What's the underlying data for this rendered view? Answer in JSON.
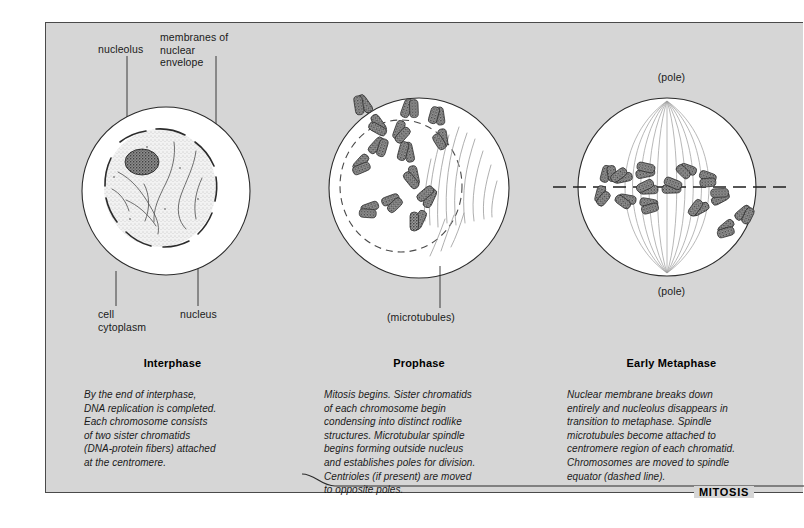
{
  "figure": {
    "bracket_label": "MITOSIS",
    "background_color": "#d6d6d6",
    "frame_border_color": "#4a4a4a"
  },
  "panels": [
    {
      "id": "interphase",
      "title": "Interphase",
      "caption": "By the end of interphase,\nDNA replication is completed.\nEach chromosome consists\nof two sister chromatids\n(DNA-protein fibers) attached\nat the centromere.",
      "callouts": [
        {
          "name": "nucleolus",
          "text": "nucleolus"
        },
        {
          "name": "nuclear-envelope",
          "text": "membranes of\nnuclear\nenvelope"
        },
        {
          "name": "cell-cytoplasm",
          "text": "cell\ncytoplasm"
        },
        {
          "name": "nucleus",
          "text": "nucleus"
        }
      ]
    },
    {
      "id": "prophase",
      "title": "Prophase",
      "caption": "Mitosis begins. Sister chromatids\nof each chromosome begin\ncondensing into distinct rodlike\nstructures. Microtubular spindle\nbegins forming outside nucleus\nand establishes poles for division.\nCentrioles (if present) are moved\nto opposite poles.",
      "callouts": [
        {
          "name": "microtubules",
          "text": "(microtubules)"
        }
      ]
    },
    {
      "id": "early-metaphase",
      "title": "Early Metaphase",
      "caption": "Nuclear membrane breaks down\nentirely and nucleolus disappears in\ntransition to metaphase. Spindle\nmicrotubules become attached to\ncentromere region of each chromatid.\nChromosomes are moved to spindle\nequator (dashed line).",
      "callouts": [
        {
          "name": "pole-top",
          "text": "(pole)"
        },
        {
          "name": "pole-bottom",
          "text": "(pole)"
        }
      ]
    }
  ]
}
